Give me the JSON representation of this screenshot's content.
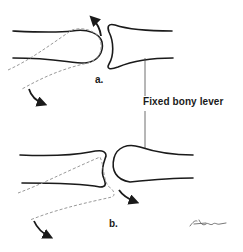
{
  "figure": {
    "panels": [
      {
        "id": "a",
        "label": "a.",
        "description": "Convex proximal bone head rotating against fixed concave base"
      },
      {
        "id": "b",
        "label": "b.",
        "description": "Concave bone end rotating around fixed convex head"
      }
    ],
    "callout": {
      "label": "Fixed bony lever"
    },
    "signature": {
      "label": "artist-signature"
    },
    "colors": {
      "bone_outline": "#1a1a1a",
      "motion_path": "#9a9a9a",
      "arrow": "#1a1a1a",
      "background": "#ffffff"
    }
  }
}
